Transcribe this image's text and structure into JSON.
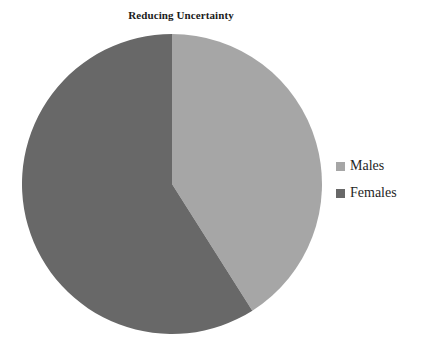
{
  "chart_data": {
    "type": "pie",
    "title": "Reducing Uncertainty",
    "xlabel": "",
    "ylabel": "",
    "categories": [
      "Males",
      "Females"
    ],
    "values": [
      41,
      59
    ],
    "slices": [
      {
        "label": "Males",
        "value": 41,
        "color": "#a6a6a6",
        "start_angle_deg": 0,
        "end_angle_deg": 147
      },
      {
        "label": "Females",
        "value": 59,
        "color": "#686868",
        "start_angle_deg": 147,
        "end_angle_deg": 360
      }
    ],
    "legend": {
      "position": "right",
      "entries": [
        {
          "label": "Males",
          "color": "#a6a6a6",
          "swatch": "legend-swatch-males"
        },
        {
          "label": "Females",
          "color": "#686868",
          "swatch": "legend-swatch-females"
        }
      ]
    },
    "grid": false,
    "start_angle": "12-oclock",
    "direction": "clockwise",
    "background_color": "#ffffff",
    "title_color": "#1b1b1b",
    "label_color": "#1f1f1f"
  }
}
